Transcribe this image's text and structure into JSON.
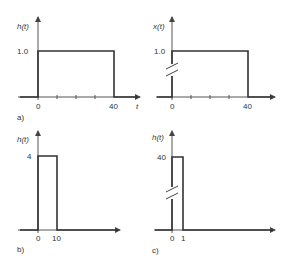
{
  "panels": [
    {
      "id": "a",
      "caption": "a)",
      "ylabel": "h(t)",
      "xlabel": "t",
      "ytick": "1.0",
      "xticks": [
        "0",
        "40"
      ],
      "pulse": {
        "start": 0,
        "end": 40,
        "height": 1.0
      },
      "break_mark": false,
      "minor_ticks": 3
    },
    {
      "id": "a2",
      "caption": "",
      "ylabel": "x(t)",
      "xlabel": "",
      "ytick": "1.0",
      "xticks": [
        "0",
        "40"
      ],
      "pulse": {
        "start": 0,
        "end": 40,
        "height": 1.0
      },
      "break_mark": true,
      "minor_ticks": 3
    },
    {
      "id": "b",
      "caption": "b)",
      "ylabel": "h(t)",
      "xlabel": "",
      "ytick": "4",
      "xticks": [
        "0",
        "10"
      ],
      "pulse": {
        "start": 0,
        "end": 10,
        "height": 4
      },
      "break_mark": false,
      "minor_ticks": 0
    },
    {
      "id": "c",
      "caption": "c)",
      "ylabel": "h(t)",
      "xlabel": "",
      "ytick": "40",
      "xticks": [
        "0",
        "1"
      ],
      "pulse": {
        "start": 0,
        "end": 1,
        "height": 40
      },
      "break_mark": true,
      "minor_ticks": 0
    }
  ],
  "colors": {
    "line": "#333333",
    "axis": "#555555"
  }
}
